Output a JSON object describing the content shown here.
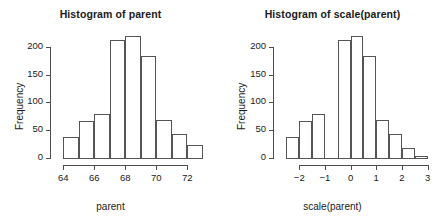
{
  "figure": {
    "background": "#ffffff",
    "line_color": "#4d4d4d",
    "bar_border_color": "#555555"
  },
  "chart_data": [
    {
      "type": "bar",
      "id": "histogram-parent",
      "title": "Histogram of parent",
      "xlabel": "parent",
      "ylabel": "Frequency",
      "grid": false,
      "legend": false,
      "xlim": [
        63.6,
        73.4
      ],
      "ylim": [
        0,
        225
      ],
      "yticks": [
        0,
        50,
        100,
        150,
        200
      ],
      "ytick_labels": [
        "0",
        "50",
        "100",
        "150",
        "200"
      ],
      "xticks": [
        64,
        66,
        68,
        70,
        72
      ],
      "xtick_labels": [
        "64",
        "66",
        "68",
        "70",
        "72"
      ],
      "bin_edges": [
        64,
        65,
        66,
        67,
        68,
        69,
        70,
        71,
        72,
        73
      ],
      "categories": [
        "64-65",
        "65-66",
        "66-67",
        "67-68",
        "68-69",
        "69-70",
        "70-71",
        "71-72",
        "72-73"
      ],
      "values": [
        37,
        66,
        79,
        212,
        219,
        183,
        68,
        43,
        24
      ]
    },
    {
      "type": "bar",
      "id": "histogram-scale-parent",
      "title": "Histogram of scale(parent)",
      "xlabel": "scale(parent)",
      "ylabel": "Frequency",
      "grid": false,
      "legend": false,
      "xlim": [
        -2.75,
        3.25
      ],
      "ylim": [
        0,
        225
      ],
      "yticks": [
        0,
        50,
        100,
        150,
        200
      ],
      "ytick_labels": [
        "0",
        "50",
        "100",
        "150",
        "200"
      ],
      "xticks": [
        -2,
        -1,
        0,
        1,
        2,
        3
      ],
      "xtick_labels": [
        "−2",
        "−1",
        "0",
        "1",
        "2",
        "3"
      ],
      "bin_edges": [
        -2.5,
        -2.0,
        -1.5,
        -1.0,
        -0.5,
        0.0,
        0.5,
        1.0,
        1.5,
        2.0,
        2.5,
        3.0
      ],
      "categories": [
        "-2.5--2.0",
        "-2.0--1.5",
        "-1.5--1.0",
        "-1.0--0.5",
        "-0.5-0.0",
        "0.0-0.5",
        "0.5-1.0",
        "1.0-1.5",
        "1.5-2.0",
        "2.0-2.5",
        "2.5-3.0"
      ],
      "values": [
        37,
        66,
        79,
        0,
        212,
        219,
        183,
        68,
        43,
        18,
        3
      ]
    }
  ]
}
